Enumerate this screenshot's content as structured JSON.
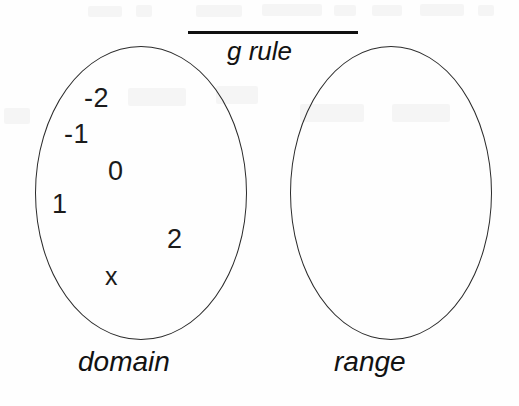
{
  "diagram": {
    "title_label": "g rule",
    "domain": {
      "caption": "domain",
      "elements": [
        {
          "label": "-2"
        },
        {
          "label": "-1"
        },
        {
          "label": "0"
        },
        {
          "label": "1"
        },
        {
          "label": "2"
        },
        {
          "label": "x"
        }
      ]
    },
    "range": {
      "caption": "range",
      "elements": []
    },
    "colors": {
      "stroke": "#2b2b2b",
      "text": "#1b1b1b",
      "rule_bar": "#111111",
      "background": "#fefefe"
    }
  }
}
